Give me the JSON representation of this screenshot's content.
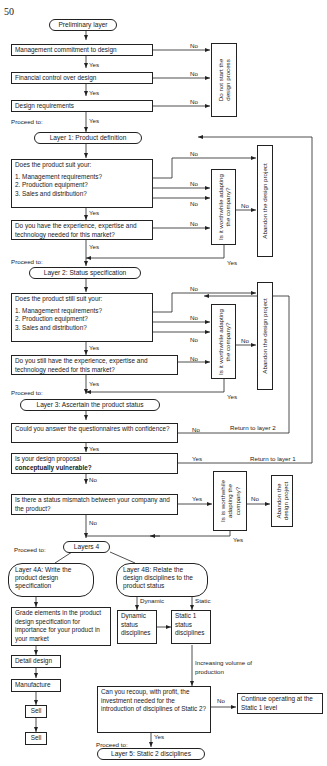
{
  "page_number": "50",
  "labels": {
    "yes": "Yes",
    "no": "No",
    "proceed_to": "Proceed to:",
    "dynamic": "Dynamic",
    "static": "Static"
  },
  "preliminary": {
    "title": "Preliminary layer",
    "steps": [
      "Management commitment to design",
      "Financial control over design",
      "Design requirements"
    ],
    "reject": "Do not start the design process"
  },
  "layer1": {
    "title": "Layer 1:  Product definition",
    "question_intro": "Does the product suit your:",
    "items": [
      "1.  Management requirements?",
      "2.  Production equipment?",
      "3.  Sales and distribution?"
    ],
    "experience_q": "Do you have the experience, expertise and technology needed for this market?",
    "worthwhile": "Is it worthwhile adapting the company?",
    "abandon": "Abandon the design project"
  },
  "layer2": {
    "title": "Layer 2:  Status specification",
    "question_intro": "Does the product still suit your:",
    "items": [
      "1.  Management requirements?",
      "2.  Production equipment?",
      "3.  Sales and distribution?"
    ],
    "experience_q": "Do you still have the experience, expertise and technology needed for this market?",
    "worthwhile": "Is it worthwhile adapting the company?",
    "abandon": "Abandon the design project"
  },
  "layer3": {
    "title": "Layer 3:  Ascertain the product status",
    "q_confidence": "Could you answer the questionnaires with confidence?",
    "return_layer2": "Return to layer 2",
    "q_vulnerable_line1": "Is your design proposal",
    "q_vulnerable_line2": "conceptually vulnerable?",
    "return_layer1": "Return to layer 1",
    "q_mismatch": "Is there a status mismatch between your company and the product?",
    "worthwhile": "Is is worthwhile adapting the company?",
    "abandon": "Abandon the design project"
  },
  "layer4": {
    "title": "Layers 4",
    "a_title": "Layer 4A:  Write the product design specification",
    "b_title": "Layer 4B:  Relate the design disciplines to the product status",
    "grade": "Grade elements in the product design specification for importance for your product in your market",
    "steps": [
      "Detail design",
      "Manufacture",
      "Sell",
      "Sell"
    ],
    "dynamic_box": "Dynamic status disciplines",
    "static_box": "Static 1 status disciplines",
    "increasing": "Increasing volume of production",
    "recoup_q": "Can you recoup, with profit, the investment needed for the introduction of disciplines of Static 2?",
    "continue": "Continue operating at the Static 1 level"
  },
  "layer5": {
    "title": "Layer 5:  Static 2 disciplines"
  }
}
